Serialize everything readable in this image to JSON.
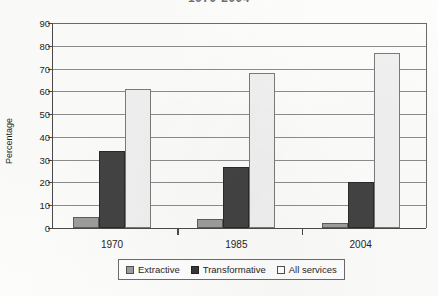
{
  "chart_data": {
    "type": "bar",
    "title": "1970-2004",
    "title_note": "partially cropped at top edge of image",
    "xlabel": "",
    "ylabel": "Percentage",
    "categories": [
      "1970",
      "1985",
      "2004"
    ],
    "series": [
      {
        "name": "Extractive",
        "color": "#9e9e9e",
        "values": [
          5,
          4,
          2
        ]
      },
      {
        "name": "Transformative",
        "color": "#434343",
        "values": [
          34,
          27,
          20
        ]
      },
      {
        "name": "All services",
        "color": "#f1f1f1",
        "values": [
          61,
          68,
          77
        ]
      }
    ],
    "ylim": [
      0,
      90
    ],
    "yticks": [
      0,
      10,
      20,
      30,
      40,
      50,
      60,
      70,
      80,
      90
    ],
    "ytick_labels": [
      "0",
      "10",
      "20",
      "30",
      "40",
      "50",
      "60",
      "70",
      "80",
      "90"
    ],
    "grid": true,
    "grid_axis": "y",
    "legend_position": "bottom"
  },
  "axis": {
    "y_title": "Percentage"
  },
  "legend": {
    "items": [
      {
        "label": "Extractive"
      },
      {
        "label": "Transformative"
      },
      {
        "label": "All services"
      }
    ]
  }
}
